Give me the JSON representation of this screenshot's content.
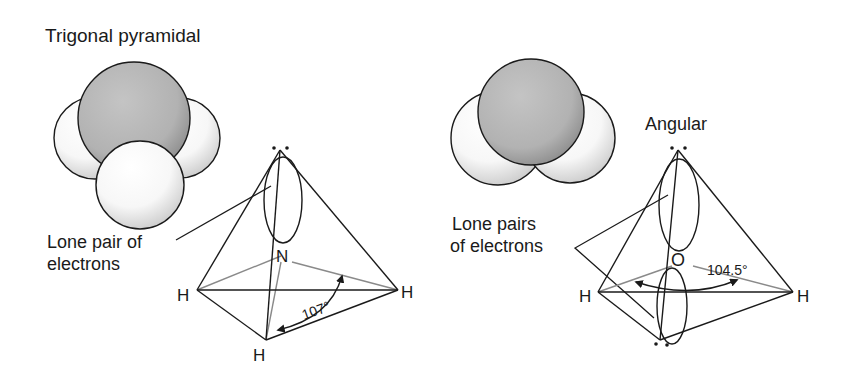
{
  "left_panel": {
    "title": "Trigonal pyramidal",
    "label_line1": "Lone pair of",
    "label_line2": "electrons",
    "central_atom": "N",
    "atoms": [
      "H",
      "H",
      "H"
    ],
    "angle": "107°"
  },
  "right_panel": {
    "title": "Angular",
    "label_line1": "Lone pairs",
    "label_line2": "of electrons",
    "central_atom": "O",
    "atoms": [
      "H",
      "H"
    ],
    "angle": "104.5°"
  },
  "colors": {
    "ink": "#1a1a1a",
    "grey_line": "#8a8a8a",
    "sphere_grey": "#b9b9b9",
    "sphere_white": "#ffffff"
  }
}
